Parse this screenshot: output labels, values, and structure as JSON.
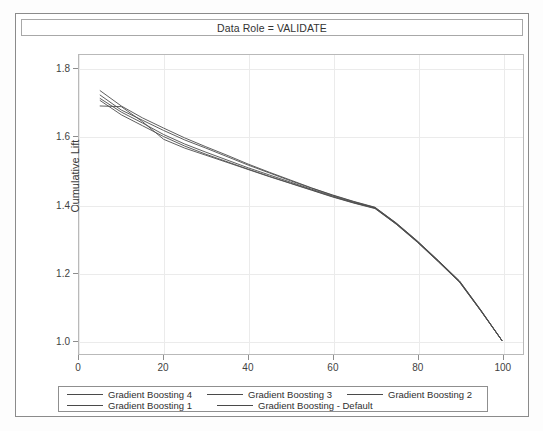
{
  "panel": {
    "title": "Data Role = VALIDATE"
  },
  "axes": {
    "x_title": "Depth",
    "y_title": "Cumulative Lift",
    "x_ticks": [
      "0",
      "20",
      "40",
      "60",
      "80",
      "100"
    ],
    "y_ticks": [
      "1.0",
      "1.2",
      "1.4",
      "1.6",
      "1.8"
    ]
  },
  "legend": {
    "items": [
      {
        "label": "Gradient Boosting 4",
        "color": "#4a4a4a"
      },
      {
        "label": "Gradient Boosting 3",
        "color": "#4a4a4a"
      },
      {
        "label": "Gradient Boosting 2",
        "color": "#4a4a4a"
      },
      {
        "label": "Gradient Boosting 1",
        "color": "#4a4a4a"
      },
      {
        "label": "Gradient Boosting - Default",
        "color": "#4a4a4a"
      }
    ]
  },
  "chart_data": {
    "type": "line",
    "title": "Data Role = VALIDATE",
    "xlabel": "Depth",
    "ylabel": "Cumulative Lift",
    "xlim": [
      0,
      105
    ],
    "ylim": [
      0.96,
      1.84
    ],
    "x_ticks": [
      0,
      20,
      40,
      60,
      80,
      100
    ],
    "y_ticks": [
      1.0,
      1.2,
      1.4,
      1.6,
      1.8
    ],
    "grid": true,
    "legend_position": "bottom",
    "x": [
      5,
      10,
      15,
      20,
      25,
      30,
      35,
      40,
      45,
      50,
      55,
      60,
      65,
      70,
      75,
      80,
      85,
      90,
      95,
      100
    ],
    "series": [
      {
        "name": "Gradient Boosting 4",
        "values": [
          1.735,
          1.69,
          1.655,
          1.625,
          1.596,
          1.57,
          1.545,
          1.519,
          1.495,
          1.472,
          1.449,
          1.428,
          1.409,
          1.392,
          1.346,
          1.293,
          1.235,
          1.175,
          1.09,
          1.0
        ]
      },
      {
        "name": "Gradient Boosting 3",
        "values": [
          1.722,
          1.678,
          1.648,
          1.618,
          1.59,
          1.566,
          1.541,
          1.516,
          1.493,
          1.47,
          1.448,
          1.427,
          1.408,
          1.391,
          1.345,
          1.292,
          1.234,
          1.174,
          1.089,
          1.0
        ]
      },
      {
        "name": "Gradient Boosting 2",
        "values": [
          1.712,
          1.672,
          1.64,
          1.606,
          1.578,
          1.554,
          1.531,
          1.508,
          1.487,
          1.466,
          1.445,
          1.425,
          1.406,
          1.39,
          1.344,
          1.291,
          1.233,
          1.173,
          1.088,
          1.0
        ]
      },
      {
        "name": "Gradient Boosting 1",
        "values": [
          1.706,
          1.664,
          1.632,
          1.6,
          1.572,
          1.548,
          1.526,
          1.504,
          1.483,
          1.463,
          1.443,
          1.423,
          1.405,
          1.389,
          1.343,
          1.29,
          1.232,
          1.172,
          1.088,
          1.0
        ]
      },
      {
        "name": "Gradient Boosting - Default",
        "values": [
          1.69,
          1.688,
          1.644,
          1.592,
          1.566,
          1.545,
          1.524,
          1.503,
          1.482,
          1.462,
          1.442,
          1.422,
          1.404,
          1.388,
          1.342,
          1.289,
          1.231,
          1.171,
          1.087,
          1.0
        ]
      }
    ]
  }
}
